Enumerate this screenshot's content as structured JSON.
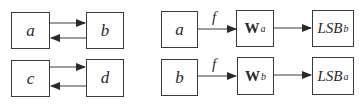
{
  "left_diagram": {
    "top": {
      "node1": "a",
      "node2": "b"
    },
    "bottom": {
      "node1": "c",
      "node2": "d"
    }
  },
  "right_diagram": {
    "top": {
      "input": "a",
      "edge_label": "f",
      "w_main": "W",
      "w_sub": "a",
      "lsb_main": "LSB",
      "lsb_sub": "b"
    },
    "bottom": {
      "input": "b",
      "edge_label": "f",
      "w_main": "W",
      "w_sub": "b",
      "lsb_main": "LSB",
      "lsb_sub": "a"
    }
  },
  "colors": {
    "stroke": "#3a3a3a",
    "text": "#2a2a2a",
    "background": "#ffffff"
  }
}
